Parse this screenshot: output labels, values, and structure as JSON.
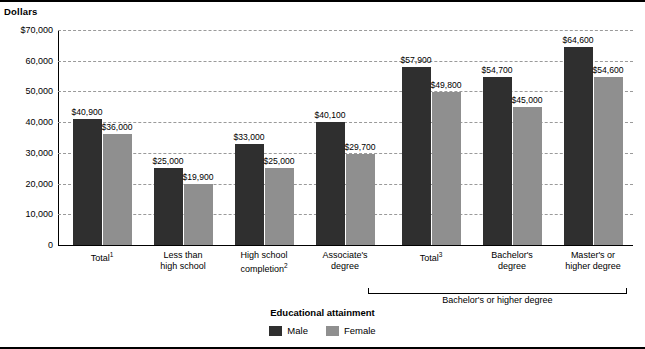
{
  "axes": {
    "y_title": "Dollars",
    "x_title": "Educational attainment",
    "y_ticks": [
      "$70,000",
      "60,000",
      "50,000",
      "40,000",
      "30,000",
      "20,000",
      "10,000",
      "0"
    ]
  },
  "legend": {
    "male_label": "Male",
    "female_label": "Female",
    "male_color": "#2f2f2f",
    "female_color": "#8f8f8f"
  },
  "bracket": {
    "label": "Bachelor's or higher degree"
  },
  "categories": [
    {
      "line1": "Total",
      "sup": "1",
      "line2": ""
    },
    {
      "line1": "Less than",
      "sup": "",
      "line2": "high school"
    },
    {
      "line1": "High school",
      "sup": "2",
      "line2": "completion"
    },
    {
      "line1": "Associate's",
      "sup": "",
      "line2": "degree"
    },
    {
      "line1": "Total",
      "sup": "3",
      "line2": ""
    },
    {
      "line1": "Bachelor's",
      "sup": "",
      "line2": "degree"
    },
    {
      "line1": "Master's or",
      "sup": "",
      "line2": "higher degree"
    }
  ],
  "chart_data": {
    "type": "bar",
    "title": "",
    "xlabel": "Educational attainment",
    "ylabel": "Dollars",
    "ylim": [
      0,
      70000
    ],
    "yticks": [
      0,
      10000,
      20000,
      30000,
      40000,
      50000,
      60000,
      70000
    ],
    "grid": true,
    "legend_position": "bottom-center",
    "categories": [
      "Total¹",
      "Less than high school completion",
      "High school completion²",
      "Associate's degree",
      "Total³",
      "Bachelor's degree",
      "Master's or higher degree"
    ],
    "series": [
      {
        "name": "Male",
        "color": "#2f2f2f",
        "values": [
          40900,
          25000,
          33000,
          40100,
          57900,
          54700,
          64600
        ],
        "labels": [
          "$40,900",
          "$25,000",
          "$33,000",
          "$40,100",
          "$57,900",
          "$54,700",
          "$64,600"
        ]
      },
      {
        "name": "Female",
        "color": "#8f8f8f",
        "values": [
          36000,
          19900,
          25000,
          29700,
          49800,
          45000,
          54600
        ],
        "labels": [
          "$36,000",
          "$19,900",
          "$25,000",
          "$29,700",
          "$49,800",
          "$45,000",
          "$54,600"
        ]
      }
    ],
    "annotations": [
      {
        "text": "Bachelor's or higher degree",
        "spans_categories": [
          "Total³",
          "Bachelor's degree",
          "Master's or higher degree"
        ]
      }
    ]
  }
}
